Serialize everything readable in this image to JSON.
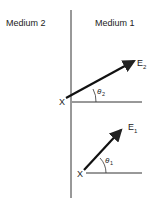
{
  "labels": {
    "medium_left": "Medium 2",
    "medium_right": "Medium 1",
    "origin_top": "X",
    "origin_bottom": "X",
    "vector_top": "E",
    "vector_top_sub": "2",
    "vector_bottom": "E",
    "vector_bottom_sub": "1",
    "angle_top": "θ",
    "angle_top_sub": "2",
    "angle_bottom": "θ",
    "angle_bottom_sub": "1"
  },
  "colors": {
    "line": "#222222",
    "background": "#ffffff"
  }
}
